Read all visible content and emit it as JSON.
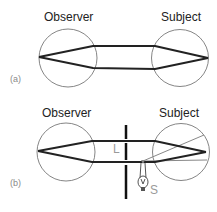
{
  "figure": {
    "panel_a": {
      "tag": "(a)",
      "left_label": "Observer",
      "right_label": "Subject"
    },
    "panel_b": {
      "tag": "(b)",
      "left_label": "Observer",
      "right_label": "Subject",
      "lens_label": "L",
      "source_label": "S"
    }
  },
  "colors": {
    "ray": "#222222",
    "eye_outline": "#777777",
    "thin_ray": "#888888",
    "barrier": "#111111",
    "label_gray": "#9a9a9a"
  }
}
